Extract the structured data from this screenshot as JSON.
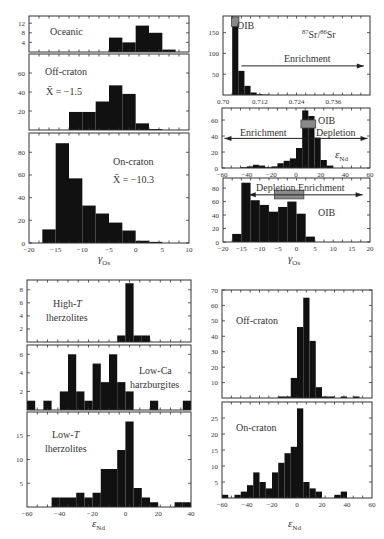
{
  "figure": {
    "width": 384,
    "height": 539,
    "colors": {
      "bar": "#111111",
      "frame": "#333333",
      "oib_box": "#8a8a8a",
      "text": "#333333",
      "background": "#ffffff"
    }
  },
  "chart_data": [
    {
      "id": "gamma-os-oceanic",
      "type": "bar",
      "title": "Oceanic",
      "frame": {
        "x": 29,
        "y": 16,
        "w": 160,
        "h": 36
      },
      "xlim": [
        -20,
        10
      ],
      "ylim": [
        0,
        15
      ],
      "yticks": [
        4,
        8,
        12
      ],
      "xticks": [],
      "xlabel": "",
      "bins": [
        [
          -5,
          -2.5,
          6
        ],
        [
          -2.5,
          0,
          4
        ],
        [
          0,
          2.5,
          11
        ],
        [
          2.5,
          5,
          8
        ],
        [
          5,
          7.5,
          1
        ]
      ],
      "annotations": [
        {
          "text": "Oceanic",
          "x": 50,
          "y": 35,
          "size": 10
        }
      ]
    },
    {
      "id": "gamma-os-off-craton",
      "type": "bar",
      "title": "Off-craton",
      "frame": {
        "x": 29,
        "y": 54,
        "w": 160,
        "h": 76
      },
      "xlim": [
        -20,
        10
      ],
      "ylim": [
        0,
        80
      ],
      "yticks": [
        20,
        40,
        60
      ],
      "xticks": [],
      "xlabel": "",
      "bins": [
        [
          -12.5,
          -10,
          19
        ],
        [
          -10,
          -7.5,
          19
        ],
        [
          -7.5,
          -5,
          30
        ],
        [
          -5,
          -2.5,
          47
        ],
        [
          -2.5,
          0,
          38
        ],
        [
          0,
          2.5,
          7
        ],
        [
          2.5,
          5,
          1
        ]
      ],
      "annotations": [
        {
          "text": "Off-craton",
          "x": 45,
          "y": 75,
          "size": 10
        },
        {
          "text": "X̄ = −1.5",
          "x": 46,
          "y": 95,
          "size": 10
        }
      ]
    },
    {
      "id": "gamma-os-on-craton",
      "type": "bar",
      "title": "On-craton",
      "frame": {
        "x": 29,
        "y": 133,
        "w": 160,
        "h": 110
      },
      "xlim": [
        -20,
        10
      ],
      "ylim": [
        0,
        97
      ],
      "yticks": [
        0,
        20,
        40,
        60,
        80
      ],
      "xticks": [
        -20,
        -15,
        -10,
        -5,
        0,
        5,
        10
      ],
      "xlabel": "γOs",
      "bins": [
        [
          -17.5,
          -15,
          12
        ],
        [
          -15,
          -12.5,
          88
        ],
        [
          -12.5,
          -10,
          57
        ],
        [
          -10,
          -7.5,
          33
        ],
        [
          -7.5,
          -5,
          26
        ],
        [
          -5,
          -2.5,
          18
        ],
        [
          -2.5,
          0,
          11
        ],
        [
          0,
          2.5,
          2
        ],
        [
          2.5,
          5,
          1
        ]
      ],
      "annotations": [
        {
          "text": "On-craton",
          "x": 113,
          "y": 165,
          "size": 10
        },
        {
          "text": "X̄ = −10.3",
          "x": 113,
          "y": 183,
          "size": 10
        }
      ]
    },
    {
      "id": "sr-isotope",
      "type": "bar",
      "title": "87Sr/86Sr",
      "frame": {
        "x": 223,
        "y": 16,
        "w": 147,
        "h": 79
      },
      "xlim": [
        0.7,
        0.748
      ],
      "ylim": [
        0,
        190
      ],
      "yticks": [
        50,
        100,
        150
      ],
      "xticks": [
        0.7,
        0.712,
        0.724,
        0.736
      ],
      "xtick_labels": [
        "0.70",
        "0.712",
        "0.724",
        "0.736"
      ],
      "xlabel": "",
      "bins": [
        [
          0.703,
          0.705,
          175
        ],
        [
          0.705,
          0.707,
          58
        ],
        [
          0.707,
          0.709,
          22
        ],
        [
          0.709,
          0.711,
          6
        ],
        [
          0.711,
          0.713,
          2
        ],
        [
          0.713,
          0.715,
          1
        ]
      ],
      "oib_box": {
        "x0": 0.7028,
        "x1": 0.7052,
        "y0": 165,
        "y1": 188
      },
      "arrows": [
        {
          "x0": 0.706,
          "x1": 0.746,
          "y": 70,
          "dir": "right"
        }
      ],
      "annotations": [
        {
          "text": "OIB",
          "x": 237,
          "y": 29,
          "size": 10
        },
        {
          "text": "Enrichment",
          "x": 284,
          "y": 62,
          "size": 10
        }
      ],
      "sr_label": {
        "sup1": "87",
        "base1": "Sr/",
        "sup2": "86",
        "base2": "Sr",
        "x": 302,
        "y": 38
      }
    },
    {
      "id": "eps-nd-oceanic",
      "type": "bar",
      "title": "εNd",
      "frame": {
        "x": 222,
        "y": 108,
        "w": 148,
        "h": 60
      },
      "xlim": [
        -60,
        60
      ],
      "ylim": [
        0,
        75
      ],
      "yticks": [
        0,
        20,
        40,
        60
      ],
      "xticks": [
        -60,
        -40,
        -20,
        0,
        20,
        40,
        60
      ],
      "xlabel": "",
      "bins": [
        [
          -45,
          -40,
          1
        ],
        [
          -40,
          -35,
          2
        ],
        [
          -35,
          -30,
          4
        ],
        [
          -30,
          -25,
          3
        ],
        [
          -25,
          -20,
          1
        ],
        [
          -20,
          -15,
          2
        ],
        [
          -15,
          -10,
          6
        ],
        [
          -10,
          -5,
          9
        ],
        [
          -5,
          0,
          12
        ],
        [
          0,
          5,
          25
        ],
        [
          5,
          10,
          72
        ],
        [
          10,
          15,
          65
        ],
        [
          15,
          20,
          38
        ],
        [
          20,
          25,
          10
        ],
        [
          25,
          30,
          3
        ]
      ],
      "oib_box": {
        "x0": 4,
        "x1": 16,
        "y0": 50,
        "y1": 60
      },
      "arrows": [
        {
          "x0": 0,
          "x1": -58,
          "y": 37,
          "dir": "left"
        },
        {
          "x0": 0,
          "x1": 58,
          "y": 37,
          "dir": "right"
        }
      ],
      "annotations": [
        {
          "text": "OIB",
          "x": 318,
          "y": 124,
          "size": 10
        },
        {
          "text": "Enrichment",
          "x": 240,
          "y": 136,
          "size": 10
        },
        {
          "text": "Depletion",
          "x": 316,
          "y": 136,
          "size": 10
        }
      ],
      "eps_label": {
        "x": 335,
        "y": 158
      }
    },
    {
      "id": "gamma-os-compare",
      "type": "bar",
      "title": "γOs",
      "frame": {
        "x": 223,
        "y": 178,
        "w": 147,
        "h": 64
      },
      "xlim": [
        -20,
        20
      ],
      "ylim": [
        0,
        95
      ],
      "yticks": [
        0,
        20,
        40,
        60,
        80
      ],
      "xticks": [
        -20,
        -15,
        -10,
        -5,
        0,
        5,
        10,
        15,
        20
      ],
      "xlabel": "γOs",
      "bins": [
        [
          -17.5,
          -15,
          12
        ],
        [
          -15,
          -12.5,
          88
        ],
        [
          -12.5,
          -10,
          62
        ],
        [
          -10,
          -7.5,
          55
        ],
        [
          -7.5,
          -5,
          45
        ],
        [
          -5,
          -2.5,
          52
        ],
        [
          -2.5,
          0,
          60
        ],
        [
          0,
          2.5,
          42
        ],
        [
          2.5,
          5,
          8
        ]
      ],
      "oib_box": {
        "x0": -6,
        "x1": 2,
        "y0": 64,
        "y1": 77
      },
      "arrows": [
        {
          "x0": -1,
          "x1": -13,
          "y": 70,
          "dir": "left"
        },
        {
          "x0": -1,
          "x1": 18,
          "y": 70,
          "dir": "right"
        }
      ],
      "annotations": [
        {
          "text": "Depletion Enrichment",
          "x": 256,
          "y": 191,
          "size": 10
        },
        {
          "text": "OIB",
          "x": 318,
          "y": 216,
          "size": 10
        }
      ]
    },
    {
      "id": "eps-nd-high-t",
      "type": "bar",
      "title": "High-T lherzolites",
      "frame": {
        "x": 27,
        "y": 280,
        "w": 164,
        "h": 62
      },
      "xlim": [
        -60,
        40
      ],
      "ylim": [
        0,
        9.5
      ],
      "yticks": [
        2,
        4,
        6,
        8
      ],
      "xticks": [],
      "xlabel": "",
      "bins": [
        [
          -5,
          0,
          1
        ],
        [
          0,
          5,
          9
        ],
        [
          5,
          10,
          1
        ],
        [
          10,
          15,
          1
        ]
      ],
      "annotations": [
        {
          "text": "High-T",
          "x": 53,
          "y": 307,
          "size": 10,
          "italicT": true
        },
        {
          "text": "lherzolites",
          "x": 46,
          "y": 321,
          "size": 10
        }
      ]
    },
    {
      "id": "eps-nd-low-ca",
      "type": "bar",
      "title": "Low-Ca harzburgites",
      "frame": {
        "x": 27,
        "y": 345,
        "w": 164,
        "h": 65
      },
      "xlim": [
        -60,
        40
      ],
      "ylim": [
        0,
        7
      ],
      "yticks": [
        2,
        4,
        6
      ],
      "xticks": [],
      "xlabel": "",
      "bins": [
        [
          -60,
          -55,
          1
        ],
        [
          -50,
          -45,
          1
        ],
        [
          -40,
          -35,
          2
        ],
        [
          -35,
          -30,
          6
        ],
        [
          -30,
          -25,
          2
        ],
        [
          -25,
          -20,
          1
        ],
        [
          -20,
          -15,
          5
        ],
        [
          -15,
          -10,
          3
        ],
        [
          -10,
          -5,
          6
        ],
        [
          -5,
          0,
          3
        ],
        [
          0,
          5,
          2
        ],
        [
          15,
          20,
          1
        ],
        [
          35,
          40,
          1
        ]
      ],
      "annotations": [
        {
          "text": "Low-Ca",
          "x": 139,
          "y": 374,
          "size": 10
        },
        {
          "text": "harzburgites",
          "x": 130,
          "y": 388,
          "size": 10
        }
      ]
    },
    {
      "id": "eps-nd-low-t",
      "type": "bar",
      "title": "Low-T lherzolites",
      "frame": {
        "x": 27,
        "y": 412,
        "w": 164,
        "h": 95
      },
      "xlim": [
        -60,
        40
      ],
      "ylim": [
        0,
        20
      ],
      "yticks": [
        5,
        10,
        15
      ],
      "xticks": [
        -60,
        -40,
        -20,
        0,
        20,
        40
      ],
      "xlabel": "εNd",
      "bins": [
        [
          -45,
          -40,
          2
        ],
        [
          -40,
          -35,
          2
        ],
        [
          -35,
          -30,
          2
        ],
        [
          -30,
          -25,
          3
        ],
        [
          -25,
          -20,
          2
        ],
        [
          -20,
          -15,
          3
        ],
        [
          -15,
          -10,
          8
        ],
        [
          -10,
          -5,
          8
        ],
        [
          -5,
          0,
          12
        ],
        [
          0,
          5,
          18
        ],
        [
          5,
          10,
          4
        ],
        [
          10,
          15,
          2
        ],
        [
          15,
          20,
          1
        ],
        [
          30,
          35,
          1
        ],
        [
          35,
          40,
          1
        ]
      ],
      "annotations": [
        {
          "text": "Low-T",
          "x": 52,
          "y": 438,
          "size": 10,
          "italicT": true
        },
        {
          "text": "lherzolites",
          "x": 45,
          "y": 452,
          "size": 10
        }
      ]
    },
    {
      "id": "eps-nd-off-craton",
      "type": "bar",
      "title": "Off-craton",
      "frame": {
        "x": 222,
        "y": 290,
        "w": 150,
        "h": 108
      },
      "xlim": [
        -60,
        60
      ],
      "ylim": [
        0,
        70
      ],
      "yticks": [
        10,
        20,
        30,
        40,
        50,
        60,
        70
      ],
      "xticks": [],
      "xlabel": "",
      "bins": [
        [
          -15,
          -10,
          1
        ],
        [
          -10,
          -5,
          1
        ],
        [
          -5,
          0,
          13
        ],
        [
          0,
          5,
          46
        ],
        [
          5,
          10,
          65
        ],
        [
          10,
          15,
          37
        ],
        [
          15,
          20,
          7
        ],
        [
          20,
          25,
          1
        ],
        [
          25,
          30,
          1
        ],
        [
          35,
          40,
          1
        ],
        [
          45,
          50,
          1
        ]
      ],
      "annotations": [
        {
          "text": "Off-craton",
          "x": 236,
          "y": 324,
          "size": 10
        }
      ]
    },
    {
      "id": "eps-nd-on-craton",
      "type": "bar",
      "title": "On-craton",
      "frame": {
        "x": 222,
        "y": 402,
        "w": 150,
        "h": 96
      },
      "xlim": [
        -60,
        60
      ],
      "ylim": [
        0,
        30
      ],
      "yticks": [
        5,
        10,
        15,
        20,
        25
      ],
      "xticks": [
        -60,
        -40,
        -20,
        0,
        20,
        40,
        60
      ],
      "xlabel": "εNd",
      "bins": [
        [
          -60,
          -55,
          1
        ],
        [
          -50,
          -45,
          1
        ],
        [
          -45,
          -40,
          2
        ],
        [
          -40,
          -35,
          4
        ],
        [
          -35,
          -30,
          8
        ],
        [
          -30,
          -25,
          5
        ],
        [
          -25,
          -20,
          3
        ],
        [
          -20,
          -15,
          8
        ],
        [
          -15,
          -10,
          11
        ],
        [
          -10,
          -5,
          14
        ],
        [
          -5,
          0,
          16
        ],
        [
          0,
          5,
          28
        ],
        [
          5,
          10,
          5
        ],
        [
          10,
          15,
          3
        ],
        [
          15,
          20,
          2
        ],
        [
          30,
          35,
          1
        ],
        [
          35,
          40,
          2
        ]
      ],
      "annotations": [
        {
          "text": "On-craton",
          "x": 236,
          "y": 431,
          "size": 10
        }
      ]
    }
  ],
  "axis_labels": [
    {
      "id": "gamma-os-left",
      "base": "γ",
      "sub": "Os",
      "x": 98,
      "y": 262
    },
    {
      "id": "gamma-os-right",
      "base": "γ",
      "sub": "Os",
      "x": 288,
      "y": 262
    },
    {
      "id": "eps-nd-lower-left",
      "base": "ε",
      "sub": "Nd",
      "x": 92,
      "y": 527
    },
    {
      "id": "eps-nd-lower-right",
      "base": "ε",
      "sub": "Nd",
      "x": 288,
      "y": 527
    }
  ]
}
